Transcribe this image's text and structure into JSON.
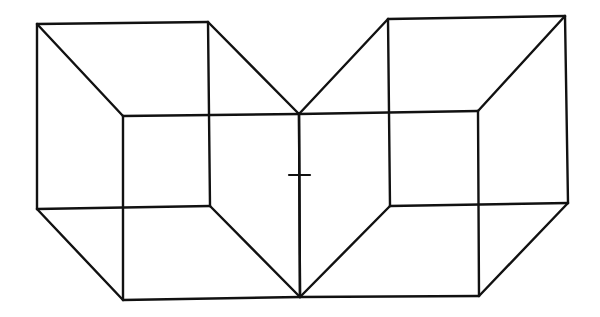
{
  "figure": {
    "type": "line-drawing",
    "stroke_color": "#111111",
    "background_color": "#ffffff",
    "cubes": [
      {
        "name": "left-cube",
        "back_face": [
          [
            37,
            24
          ],
          [
            208,
            22
          ],
          [
            210,
            206
          ],
          [
            37,
            209
          ]
        ],
        "front_face": [
          [
            123,
            116
          ],
          [
            299,
            114
          ],
          [
            300,
            297
          ],
          [
            123,
            300
          ]
        ],
        "connectors": [
          [
            [
              37,
              24
            ],
            [
              123,
              116
            ]
          ],
          [
            [
              208,
              22
            ],
            [
              299,
              114
            ]
          ],
          [
            [
              210,
              206
            ],
            [
              300,
              297
            ]
          ],
          [
            [
              37,
              209
            ],
            [
              123,
              300
            ]
          ]
        ]
      },
      {
        "name": "right-cube",
        "back_face": [
          [
            388,
            19
          ],
          [
            565,
            16
          ],
          [
            568,
            203
          ],
          [
            390,
            206
          ]
        ],
        "front_face": [
          [
            299,
            114
          ],
          [
            478,
            111
          ],
          [
            479,
            296
          ],
          [
            300,
            297
          ]
        ],
        "connectors": [
          [
            [
              388,
              19
            ],
            [
              299,
              114
            ]
          ],
          [
            [
              565,
              16
            ],
            [
              478,
              111
            ]
          ],
          [
            [
              568,
              203
            ],
            [
              479,
              296
            ]
          ],
          [
            [
              390,
              206
            ],
            [
              300,
              297
            ]
          ]
        ]
      }
    ],
    "fixation_cross": {
      "center": [
        299,
        175
      ],
      "horizontal": [
        [
          289,
          175
        ],
        [
          310,
          175
        ]
      ]
    }
  }
}
